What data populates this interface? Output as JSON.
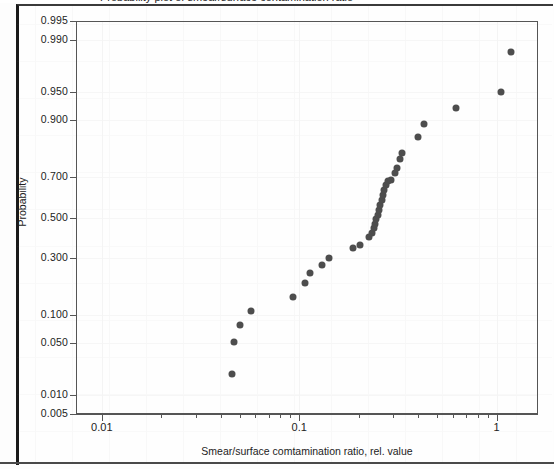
{
  "page": {
    "top_cut_text": "Probability plot of smear/surface contamination ratio"
  },
  "chart_data": {
    "type": "scatter",
    "title": "",
    "xlabel": "Smear/surface comtamination ratio, rel. value",
    "ylabel": "Probability",
    "xscale": "log",
    "yscale": "probability",
    "grid": false,
    "legend": "none",
    "xlim": [
      0.0074,
      1.62
    ],
    "ylim": [
      0.005,
      0.995
    ],
    "x_ticks": [
      {
        "value": 0.01,
        "label": "0.01",
        "major": true
      },
      {
        "value": 0.02,
        "label": "",
        "major": false
      },
      {
        "value": 0.03,
        "label": "",
        "major": false
      },
      {
        "value": 0.04,
        "label": "",
        "major": false
      },
      {
        "value": 0.05,
        "label": "",
        "major": false
      },
      {
        "value": 0.06,
        "label": "",
        "major": false
      },
      {
        "value": 0.07,
        "label": "",
        "major": false
      },
      {
        "value": 0.08,
        "label": "",
        "major": false
      },
      {
        "value": 0.09,
        "label": "",
        "major": false
      },
      {
        "value": 0.1,
        "label": "0.1",
        "major": true
      },
      {
        "value": 0.2,
        "label": "",
        "major": false
      },
      {
        "value": 0.3,
        "label": "",
        "major": false
      },
      {
        "value": 0.4,
        "label": "",
        "major": false
      },
      {
        "value": 0.5,
        "label": "",
        "major": false
      },
      {
        "value": 0.6,
        "label": "",
        "major": false
      },
      {
        "value": 0.7,
        "label": "",
        "major": false
      },
      {
        "value": 0.8,
        "label": "",
        "major": false
      },
      {
        "value": 0.9,
        "label": "",
        "major": false
      },
      {
        "value": 1.0,
        "label": "1",
        "major": true
      }
    ],
    "y_ticks": [
      {
        "value": 0.995,
        "label": "0.995"
      },
      {
        "value": 0.99,
        "label": "0.990"
      },
      {
        "value": 0.95,
        "label": "0.950"
      },
      {
        "value": 0.9,
        "label": "0.900"
      },
      {
        "value": 0.7,
        "label": "0.700"
      },
      {
        "value": 0.5,
        "label": "0.500"
      },
      {
        "value": 0.3,
        "label": "0.300"
      },
      {
        "value": 0.1,
        "label": "0.100"
      },
      {
        "value": 0.05,
        "label": "0.050"
      },
      {
        "value": 0.01,
        "label": "0.010"
      },
      {
        "value": 0.005,
        "label": "0.005"
      }
    ],
    "marker": {
      "shape": "circle",
      "color": "#4d4d4d",
      "size_px": 7
    },
    "points": [
      {
        "x": 0.0455,
        "y": 0.02
      },
      {
        "x": 0.0468,
        "y": 0.052
      },
      {
        "x": 0.05,
        "y": 0.08
      },
      {
        "x": 0.057,
        "y": 0.11
      },
      {
        "x": 0.093,
        "y": 0.15
      },
      {
        "x": 0.107,
        "y": 0.195
      },
      {
        "x": 0.114,
        "y": 0.235
      },
      {
        "x": 0.13,
        "y": 0.265
      },
      {
        "x": 0.142,
        "y": 0.3
      },
      {
        "x": 0.188,
        "y": 0.345
      },
      {
        "x": 0.202,
        "y": 0.36
      },
      {
        "x": 0.226,
        "y": 0.4
      },
      {
        "x": 0.233,
        "y": 0.42
      },
      {
        "x": 0.238,
        "y": 0.445
      },
      {
        "x": 0.242,
        "y": 0.465
      },
      {
        "x": 0.246,
        "y": 0.49
      },
      {
        "x": 0.25,
        "y": 0.515
      },
      {
        "x": 0.254,
        "y": 0.54
      },
      {
        "x": 0.258,
        "y": 0.565
      },
      {
        "x": 0.262,
        "y": 0.59
      },
      {
        "x": 0.266,
        "y": 0.615
      },
      {
        "x": 0.27,
        "y": 0.64
      },
      {
        "x": 0.274,
        "y": 0.665
      },
      {
        "x": 0.28,
        "y": 0.685
      },
      {
        "x": 0.29,
        "y": 0.69
      },
      {
        "x": 0.305,
        "y": 0.72
      },
      {
        "x": 0.312,
        "y": 0.74
      },
      {
        "x": 0.325,
        "y": 0.78
      },
      {
        "x": 0.33,
        "y": 0.8
      },
      {
        "x": 0.4,
        "y": 0.855
      },
      {
        "x": 0.43,
        "y": 0.89
      },
      {
        "x": 0.62,
        "y": 0.925
      },
      {
        "x": 1.05,
        "y": 0.95
      },
      {
        "x": 1.18,
        "y": 0.985
      }
    ]
  }
}
